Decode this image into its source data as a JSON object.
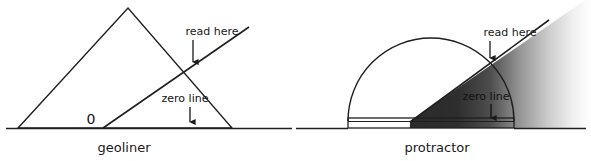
{
  "figure": {
    "background_color": "#ffffff",
    "line_color": "#1f1f1f",
    "shade_dark_color": "#2b2b2b",
    "shade_light_color": "#ffffff"
  },
  "panels": [
    {
      "id": "geoliner",
      "caption": "geoliner",
      "shape": "triangle",
      "zero_mark_label": "0",
      "annotations": [
        {
          "id": "read-here",
          "label": "read here",
          "arrow": "down"
        },
        {
          "id": "zero-line",
          "label": "zero line",
          "arrow": "down"
        }
      ],
      "geometry": {
        "baseline_y": 128,
        "baseline_x1": 6,
        "baseline_x2": 288,
        "triangle_apex": [
          128,
          8
        ],
        "triangle_left": [
          18,
          128
        ],
        "triangle_right": [
          232,
          128
        ],
        "ray_origin": [
          103,
          128
        ],
        "ray_end": [
          248,
          28
        ],
        "intersection": [
          196,
          68
        ]
      }
    },
    {
      "id": "protractor",
      "caption": "protractor",
      "shape": "semicircle",
      "zero_mark_label": "",
      "annotations": [
        {
          "id": "read-here",
          "label": "read here",
          "arrow": "down"
        },
        {
          "id": "zero-line",
          "label": "zero line",
          "arrow": "down"
        }
      ],
      "geometry": {
        "baseline_y": 128,
        "baseline_x1": 296,
        "baseline_x2": 586,
        "center": [
          431,
          121
        ],
        "radius": 83,
        "bar_left": 348,
        "bar_right": 514,
        "bar_top": 118,
        "bar_bottom": 128,
        "ray_origin": [
          410,
          121
        ],
        "ray_end": [
          548,
          21
        ],
        "intersection": [
          492,
          62
        ]
      }
    }
  ]
}
